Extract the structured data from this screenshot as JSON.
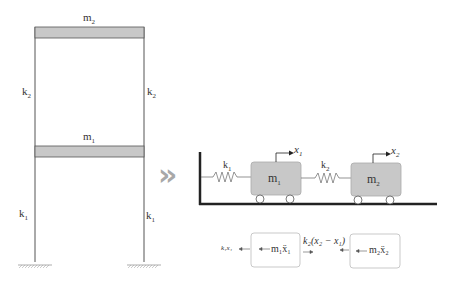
{
  "frame": {
    "top_mass": {
      "base": "m",
      "sub": "2"
    },
    "bottom_mass": {
      "base": "m",
      "sub": "1"
    },
    "upper_left_stiffness": {
      "base": "k",
      "sub": "2"
    },
    "upper_right_stiffness": {
      "base": "k",
      "sub": "2"
    },
    "lower_left_stiffness": {
      "base": "k",
      "sub": "1"
    },
    "lower_right_stiffness": {
      "base": "k",
      "sub": "1"
    },
    "slab_color": "#c8c8c8"
  },
  "arrow_glyph": "»",
  "arrow_color": "#a8a8a8",
  "model": {
    "spring1": {
      "base": "k",
      "sub": "1"
    },
    "spring2": {
      "base": "k",
      "sub": "2"
    },
    "mass1": {
      "base": "m",
      "sub": "1"
    },
    "mass2": {
      "base": "m",
      "sub": "2"
    },
    "disp1": {
      "base": "x",
      "sub": "1"
    },
    "disp2": {
      "base": "x",
      "sub": "2"
    },
    "mass_color": "#c8c8c8"
  },
  "free_body": {
    "spring_force_1": "k₁x₁",
    "inertia_1": "m₁ẍ₁",
    "coupling_force": "k₂(x₂ − x₁)",
    "inertia_2": "m₂ẍ₂"
  }
}
